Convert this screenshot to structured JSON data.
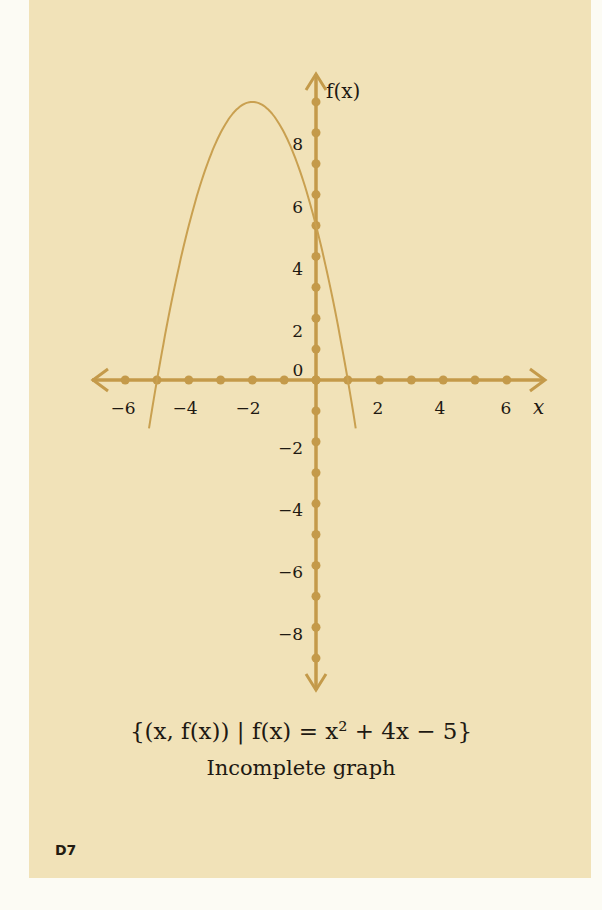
{
  "chart_data": {
    "type": "line",
    "title": "{(x, f(x)) | f(x) = x² + 4x − 5}",
    "subtitle": "Incomplete graph",
    "xlabel": "x",
    "ylabel": "f(x)",
    "x_tick_labels": [
      "−6",
      "−4",
      "−2",
      "2",
      "4",
      "6"
    ],
    "y_tick_labels": [
      "8",
      "6",
      "4",
      "2",
      "0",
      "−2",
      "−4",
      "−6",
      "−8"
    ],
    "xlim": [
      -6.5,
      6.5
    ],
    "ylim": [
      -9.5,
      9.5
    ],
    "grid": false,
    "series": [
      {
        "name": "plotted parabola (vertex at (−2, 9), roots −5 and 1)",
        "x": [
          -5.2,
          -5,
          -4,
          -3,
          -2,
          -1,
          0,
          1,
          1.2
        ],
        "values": [
          -0.84,
          0,
          5,
          8,
          9,
          8,
          5,
          0,
          -1.24
        ]
      }
    ],
    "colors": {
      "axis": "#c49a4a",
      "curve": "#c9a050",
      "text": "#1e1912"
    }
  },
  "labels": {
    "y_axis": "f(x)",
    "x_axis": "x",
    "origin": "0",
    "x_ticks": [
      {
        "label": "−6",
        "x": 123
      },
      {
        "label": "−4",
        "x": 185
      },
      {
        "label": "−2",
        "x": 248
      },
      {
        "label": "2",
        "x": 378
      },
      {
        "label": "4",
        "x": 440
      },
      {
        "label": "6",
        "x": 506
      }
    ],
    "y_ticks": [
      {
        "label": "8",
        "y": 144
      },
      {
        "label": "6",
        "y": 207
      },
      {
        "label": "4",
        "y": 269
      },
      {
        "label": "2",
        "y": 331
      },
      {
        "label": "−2",
        "y": 448
      },
      {
        "label": "−4",
        "y": 510
      },
      {
        "label": "−6",
        "y": 572
      },
      {
        "label": "−8",
        "y": 634
      }
    ]
  },
  "caption": {
    "equation": "{(x, f(x)) | f(x) = x² + 4x − 5}",
    "note": "Incomplete graph"
  },
  "page_number": "D7"
}
